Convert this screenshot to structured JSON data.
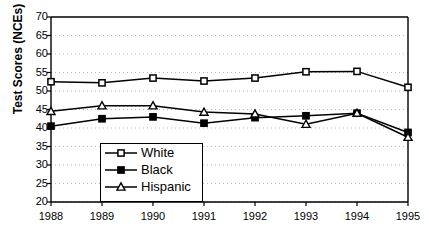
{
  "chart_data": {
    "type": "line",
    "title": "",
    "xlabel": "",
    "ylabel": "Test Scores (NCEs)",
    "categories": [
      "1988",
      "1989",
      "1990",
      "1991",
      "1992",
      "1993",
      "1994",
      "1995"
    ],
    "ylim": [
      20,
      70
    ],
    "yticks": [
      20,
      25,
      30,
      35,
      40,
      45,
      50,
      55,
      60,
      65,
      70
    ],
    "grid": "horizontal-dotted",
    "legend_position": "inside-lower-left",
    "series": [
      {
        "name": "White",
        "marker": "open-square",
        "values": [
          52.5,
          52.2,
          53.5,
          52.7,
          53.5,
          55.2,
          55.3,
          51.0
        ]
      },
      {
        "name": "Black",
        "marker": "filled-square",
        "values": [
          40.5,
          42.5,
          43.0,
          41.3,
          42.8,
          43.3,
          44.0,
          38.8
        ]
      },
      {
        "name": "Hispanic",
        "marker": "open-triangle",
        "values": [
          44.5,
          46.0,
          46.0,
          44.3,
          43.8,
          41.0,
          44.0,
          37.5
        ]
      }
    ]
  },
  "colors": {
    "line": "#000000",
    "grid": "#b8b8b8",
    "axis": "#000000",
    "background": "#ffffff"
  },
  "legend": {
    "items": [
      {
        "label": "White"
      },
      {
        "label": "Black"
      },
      {
        "label": "Hispanic"
      }
    ]
  }
}
